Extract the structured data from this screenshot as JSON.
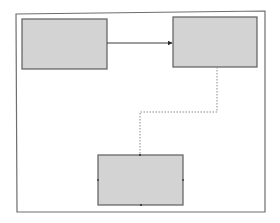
{
  "diagram": {
    "frame": {
      "x1": 16,
      "y1": 14,
      "x2": 265,
      "y2": 212,
      "stroke": "#6e6e6e"
    },
    "nodes": [
      {
        "id": "box-a",
        "label": "",
        "x": 22,
        "y": 19,
        "w": 85,
        "h": 50,
        "fill": "#d3d3d3",
        "stroke": "#5e5e5e"
      },
      {
        "id": "box-b",
        "label": "",
        "x": 173,
        "y": 17,
        "w": 84,
        "h": 50,
        "fill": "#d3d3d3",
        "stroke": "#5e5e5e"
      },
      {
        "id": "box-c",
        "label": "",
        "x": 98,
        "y": 155,
        "w": 85,
        "h": 50,
        "fill": "#d3d3d3",
        "stroke": "#5e5e5e"
      }
    ],
    "edges": [
      {
        "id": "edge-a-b",
        "from": "box-a",
        "to": "box-b",
        "style": "solid",
        "arrow": true,
        "stroke": "#3a3a3a"
      },
      {
        "id": "edge-b-c",
        "from": "box-b",
        "to": "box-c",
        "style": "dotted",
        "arrow": false,
        "stroke": "#8a8a8a"
      }
    ]
  }
}
